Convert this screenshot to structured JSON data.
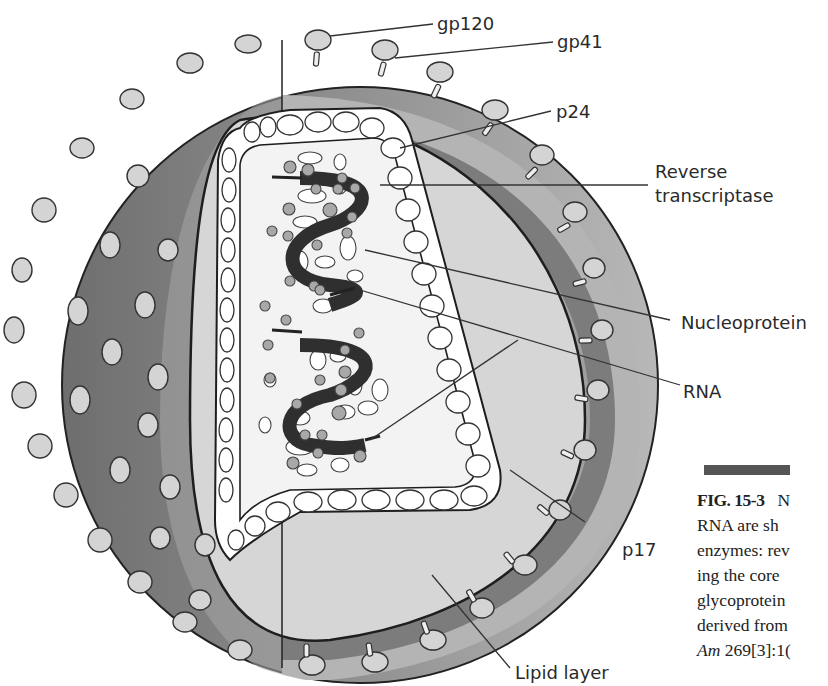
{
  "figure": {
    "labels": {
      "gp120": "gp120",
      "gp41": "gp41",
      "p24": "p24",
      "reverse_transcriptase_1": "Reverse",
      "reverse_transcriptase_2": "transcriptase",
      "nucleoprotein": "Nucleoprotein",
      "rna": "RNA",
      "p17": "p17",
      "lipid_layer": "Lipid layer"
    },
    "colors": {
      "outer_sphere": "#8c8c8c",
      "lipid_band": "#b0b0b0",
      "matrix_band": "#7a7a7a",
      "inner_fill": "#d8d8d8",
      "core_fill": "#f2f2f2",
      "rna_strand": "#2f2f2f",
      "nucleoprotein_dot": "#a8a8a8",
      "spike_head": "#d4d4d4"
    }
  },
  "caption": {
    "number": "FIG. 15-3",
    "lines": [
      "N",
      "RNA are sh",
      "enzymes: rev",
      "ing the core",
      "glycoprotein",
      "derived from",
      "269[3]:1("
    ],
    "journal_abbrev": "Am"
  }
}
